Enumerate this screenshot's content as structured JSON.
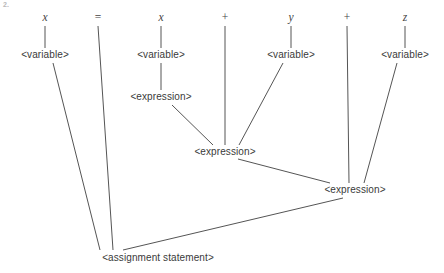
{
  "figure": {
    "label": "2.",
    "caption_expression": "x = x + y + z",
    "background_color": "#ffffff",
    "edge_color": "#555555",
    "text_color": "#3b3b3b"
  },
  "terminals": [
    {
      "id": "t-x1",
      "text": "x",
      "kind": "identifier",
      "x": 45,
      "y": 18
    },
    {
      "id": "t-eq",
      "text": "=",
      "kind": "operator",
      "x": 98,
      "y": 18
    },
    {
      "id": "t-x2",
      "text": "x",
      "kind": "identifier",
      "x": 161,
      "y": 18
    },
    {
      "id": "t-p1",
      "text": "+",
      "kind": "operator",
      "x": 225,
      "y": 18
    },
    {
      "id": "t-y",
      "text": "y",
      "kind": "identifier",
      "x": 291,
      "y": 18
    },
    {
      "id": "t-p2",
      "text": "+",
      "kind": "operator",
      "x": 347,
      "y": 18
    },
    {
      "id": "t-z",
      "text": "z",
      "kind": "identifier",
      "x": 405,
      "y": 18
    }
  ],
  "nonterminals": [
    {
      "id": "v1",
      "text": "<variable>",
      "x": 45,
      "y": 55
    },
    {
      "id": "v2",
      "text": "<variable>",
      "x": 161,
      "y": 55
    },
    {
      "id": "v3",
      "text": "<variable>",
      "x": 291,
      "y": 55
    },
    {
      "id": "v4",
      "text": "<variable>",
      "x": 405,
      "y": 55
    },
    {
      "id": "e1",
      "text": "<expression>",
      "x": 161,
      "y": 97
    },
    {
      "id": "e2",
      "text": "<expression>",
      "x": 225,
      "y": 152
    },
    {
      "id": "e3",
      "text": "<expression>",
      "x": 355,
      "y": 190
    },
    {
      "id": "root",
      "text": "<assignment statement>",
      "x": 158,
      "y": 258
    }
  ],
  "edges": [
    {
      "from": "t-x1",
      "to": "v1",
      "x1": 45,
      "y1": 26,
      "x2": 45,
      "y2": 48
    },
    {
      "from": "t-eq",
      "to": "root",
      "x1": 98,
      "y1": 26,
      "x2": 113,
      "y2": 250
    },
    {
      "from": "t-x2",
      "to": "v2",
      "x1": 161,
      "y1": 26,
      "x2": 161,
      "y2": 48
    },
    {
      "from": "t-p1",
      "to": "e2",
      "x1": 225,
      "y1": 26,
      "x2": 225,
      "y2": 145
    },
    {
      "from": "t-y",
      "to": "v3",
      "x1": 291,
      "y1": 26,
      "x2": 291,
      "y2": 48
    },
    {
      "from": "t-p2",
      "to": "e3",
      "x1": 347,
      "y1": 26,
      "x2": 349,
      "y2": 183
    },
    {
      "from": "t-z",
      "to": "v4",
      "x1": 405,
      "y1": 26,
      "x2": 405,
      "y2": 48
    },
    {
      "from": "v1",
      "to": "root",
      "x1": 53,
      "y1": 63,
      "x2": 100,
      "y2": 250
    },
    {
      "from": "v2",
      "to": "e1",
      "x1": 161,
      "y1": 63,
      "x2": 161,
      "y2": 90
    },
    {
      "from": "v3",
      "to": "e2",
      "x1": 283,
      "y1": 63,
      "x2": 239,
      "y2": 145
    },
    {
      "from": "v4",
      "to": "e3",
      "x1": 397,
      "y1": 63,
      "x2": 364,
      "y2": 183
    },
    {
      "from": "e1",
      "to": "e2",
      "x1": 172,
      "y1": 105,
      "x2": 213,
      "y2": 145
    },
    {
      "from": "e2",
      "to": "e3",
      "x1": 238,
      "y1": 159,
      "x2": 330,
      "y2": 183
    },
    {
      "from": "e3",
      "to": "root",
      "x1": 343,
      "y1": 198,
      "x2": 123,
      "y2": 250
    }
  ]
}
